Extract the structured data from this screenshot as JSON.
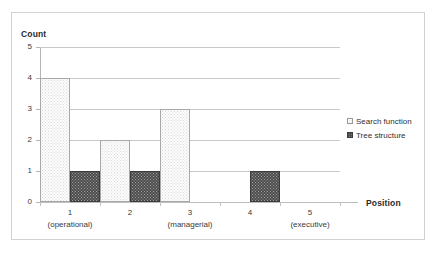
{
  "chart_data": {
    "type": "bar",
    "title": "",
    "xlabel": "Position",
    "ylabel": "Count",
    "ylim": [
      0,
      5
    ],
    "yticks": [
      "0",
      "1",
      "2",
      "3",
      "4",
      "5"
    ],
    "grid": true,
    "legend_position": "right",
    "categories": [
      "1",
      "2",
      "3",
      "4",
      "5"
    ],
    "category_sublabels": [
      "(operational)",
      "",
      "(managerial)",
      "",
      "(executive)"
    ],
    "series": [
      {
        "name": "Search function",
        "values": [
          4,
          2,
          3,
          0,
          0
        ],
        "color": "#fdfdfd",
        "pattern": "light-dotted"
      },
      {
        "name": "Tree structure",
        "values": [
          1,
          1,
          0,
          1,
          0
        ],
        "color": "#4d4d4d",
        "pattern": "dark-dotted"
      }
    ]
  },
  "axes": {
    "y_title": "Count",
    "x_title": "Position"
  },
  "legend": {
    "items": [
      {
        "label": "Search function"
      },
      {
        "label": "Tree structure"
      }
    ]
  },
  "colors": {
    "grid": "#c8c8c8",
    "axis": "#b5b5b5",
    "frame": "#d2d2d2",
    "series_search": "#fdfdfd",
    "series_tree": "#4d4d4d",
    "text": "#3a3a3a"
  }
}
